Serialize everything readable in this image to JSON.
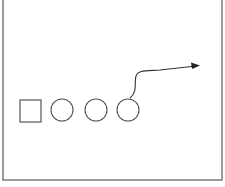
{
  "diagram": {
    "stroke_color": "#555555",
    "frame_color": "#666666",
    "background": "#ffffff",
    "frame": {
      "x": 3,
      "y": -2,
      "width": 219,
      "height": 182
    },
    "shapes": [
      {
        "type": "square",
        "x": 20,
        "y": 100,
        "width": 21,
        "height": 22
      },
      {
        "type": "circle",
        "cx": 62,
        "cy": 110,
        "r": 11
      },
      {
        "type": "circle",
        "cx": 96,
        "cy": 110,
        "r": 11
      },
      {
        "type": "circle",
        "cx": 128,
        "cy": 110,
        "r": 11
      }
    ],
    "arrow": {
      "from": "circle-3-top",
      "path": "M130 98 C 138 92, 134 82, 136 76 C 138 70, 146 71, 160 70 L 196 66",
      "head": "196,66 190,63 191,69"
    }
  }
}
